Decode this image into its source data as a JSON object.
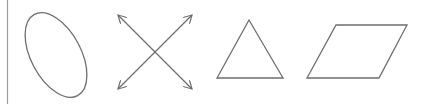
{
  "figure": {
    "stroke_color": "#6e6e6e",
    "shapes": [
      {
        "name": "ellipse",
        "label": ""
      },
      {
        "name": "crossed-double-arrows",
        "label": ""
      },
      {
        "name": "triangle",
        "label": ""
      },
      {
        "name": "parallelogram",
        "label": ""
      }
    ]
  }
}
